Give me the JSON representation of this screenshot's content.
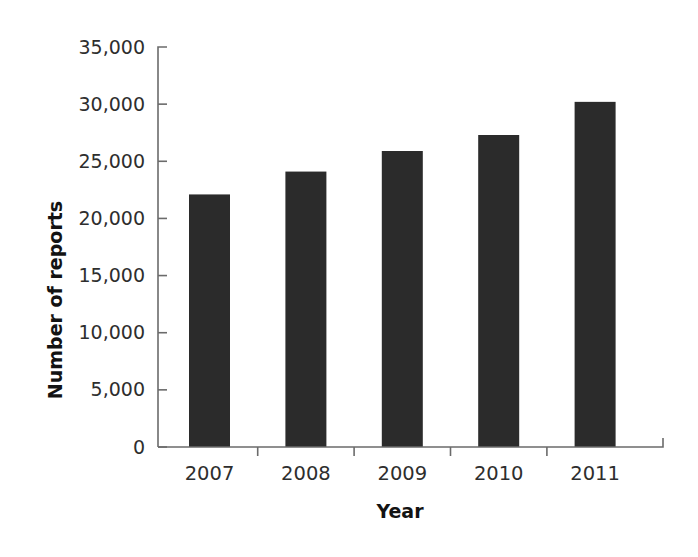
{
  "chart_data": {
    "type": "bar",
    "title": "",
    "subtitle": "",
    "categories": [
      "2007",
      "2008",
      "2009",
      "2010",
      "2011"
    ],
    "values": [
      22100,
      24100,
      25900,
      27300,
      30200
    ],
    "series": [
      {
        "name": "Number of reports",
        "values": [
          22100,
          24100,
          25900,
          27300,
          30200
        ]
      }
    ],
    "xlabel": "Year",
    "ylabel": "Number of reports",
    "ylim": [
      0,
      35000
    ],
    "ytick_values": [
      0,
      5000,
      10000,
      15000,
      20000,
      25000,
      30000,
      35000
    ],
    "ytick_labels": [
      "0",
      "5,000",
      "10,000",
      "15,000",
      "20,000",
      "25,000",
      "30,000",
      "35,000"
    ],
    "grid": false,
    "legend": false,
    "legend_position": "none",
    "bar_color": "#2b2b2b",
    "background_color": "#ffffff",
    "axis_color": "#6b6b6b",
    "text_color": "#2e2e2e"
  },
  "axes": {
    "y_title": "Number of reports",
    "x_title": "Year"
  }
}
